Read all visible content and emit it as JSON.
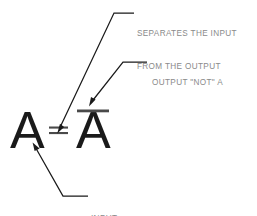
{
  "diagram": {
    "background_color": "#ffffff",
    "expression": {
      "input_symbol": "A",
      "equals_symbol": "=",
      "output_symbol": "A",
      "output_has_overbar": true,
      "ink_color": "#1a1a1a"
    },
    "annotations": [
      {
        "id": "separates",
        "line1": "SEPARATES THE INPUT",
        "line2": "FROM THE OUTPUT",
        "points_to": "equals-sign",
        "text_color": "#8a8a8a"
      },
      {
        "id": "output-not",
        "line1": "OUTPUT \"NOT\" A",
        "points_to": "overbar",
        "text_color": "#8a8a8a"
      },
      {
        "id": "input",
        "line1": "INPUT",
        "points_to": "input-a",
        "text_color": "#8a8a8a"
      }
    ],
    "leader_line_color": "#1a1a1a"
  }
}
